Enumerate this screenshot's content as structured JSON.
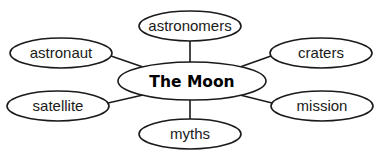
{
  "diagram": {
    "type": "concept-map",
    "center": {
      "label": "The Moon",
      "cx": 192,
      "cy": 81,
      "rx": 74,
      "ry": 19
    },
    "nodes": [
      {
        "label": "astronomers",
        "cx": 190,
        "cy": 26,
        "rx": 51,
        "ry": 15
      },
      {
        "label": "astronaut",
        "cx": 61,
        "cy": 53,
        "rx": 51,
        "ry": 15
      },
      {
        "label": "craters",
        "cx": 321,
        "cy": 53,
        "rx": 51,
        "ry": 15
      },
      {
        "label": "satellite",
        "cx": 58,
        "cy": 106,
        "rx": 51,
        "ry": 15
      },
      {
        "label": "mission",
        "cx": 322,
        "cy": 106,
        "rx": 51,
        "ry": 15
      },
      {
        "label": "myths",
        "cx": 190,
        "cy": 134,
        "rx": 51,
        "ry": 15
      }
    ],
    "colors": {
      "stroke": "#1a1a1a",
      "fill": "#ffffff",
      "text": "#1a1a1a"
    }
  }
}
